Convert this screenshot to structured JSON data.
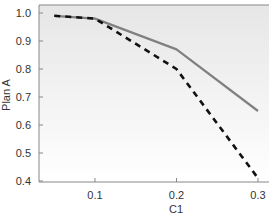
{
  "chart_data": {
    "type": "line",
    "title": "",
    "xlabel": "C1",
    "ylabel": "Plan A",
    "x": [
      0.05,
      0.1,
      0.2,
      0.3
    ],
    "series": [
      {
        "name": "solid",
        "style": "solid",
        "color": "#808080",
        "values": [
          0.99,
          0.98,
          0.87,
          0.65
        ]
      },
      {
        "name": "dashed",
        "style": "dashed",
        "color": "#111111",
        "values": [
          0.99,
          0.98,
          0.8,
          0.41
        ]
      }
    ],
    "xlim": [
      0.03,
      0.31
    ],
    "ylim": [
      0.4,
      1.0
    ],
    "xticks": [
      0.1,
      0.2,
      0.3
    ],
    "xtick_labels": [
      "0.1",
      "0.2",
      "0.3"
    ],
    "yticks": [
      0.4,
      0.5,
      0.6,
      0.7,
      0.8,
      0.9,
      1.0
    ],
    "ytick_labels": [
      "0.4",
      "0.5",
      "0.6",
      "0.7",
      "0.8",
      "0.9",
      "1.0"
    ],
    "grid": false,
    "legend": null,
    "background": {
      "top": "#e6e6e6",
      "bottom": "#ffffff"
    }
  }
}
